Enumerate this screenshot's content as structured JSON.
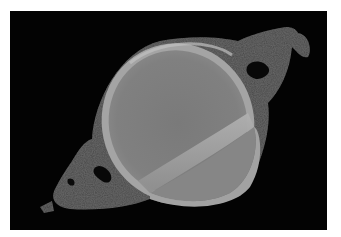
{
  "image": {
    "subject": "grayscale scan of an oval grain with a diagonal ridge, surrounded by a speckled halo on black background",
    "background_color": "#030303",
    "frame_color": "#ffffff",
    "colors": {
      "halo": "#4a4a4a",
      "rim": "#a8a8a8",
      "body": "#7e7e7e",
      "ridge": "#9c9c9c"
    }
  }
}
